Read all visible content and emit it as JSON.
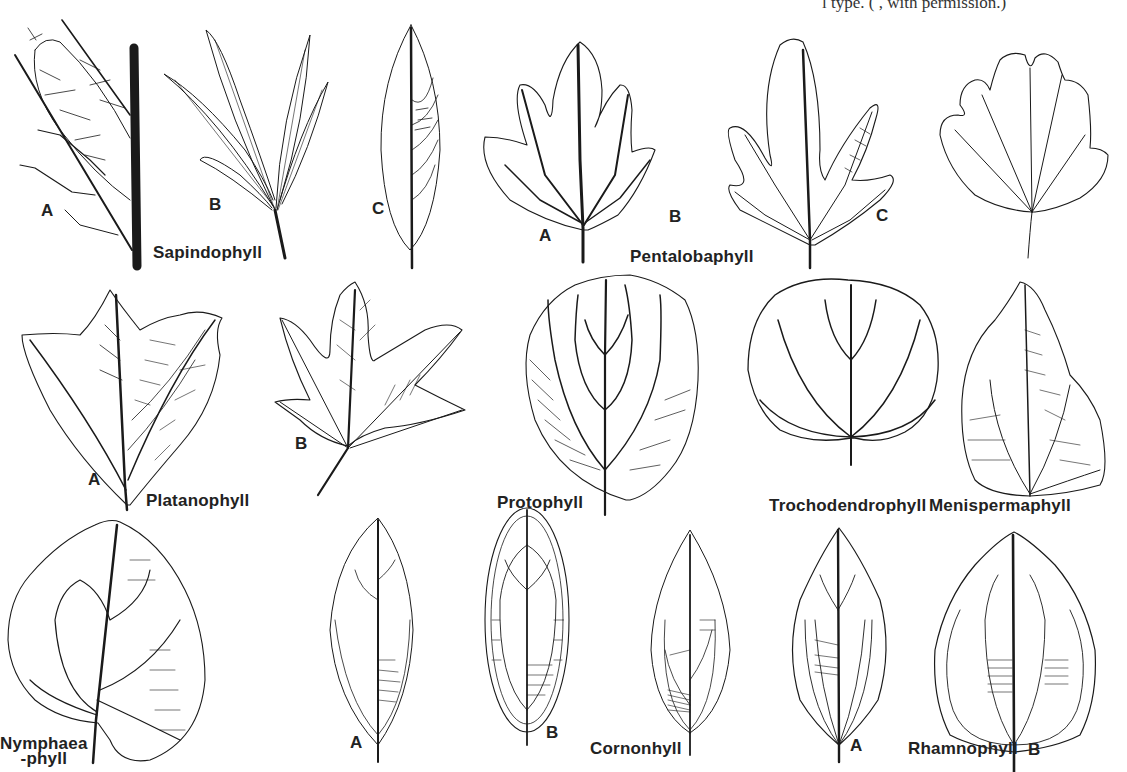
{
  "figure": {
    "caption_fragment": "l type. (               , with permission.)",
    "line_color": "#1a1a1a",
    "background": "#ffffff",
    "rows": [
      {
        "row": 1,
        "morphotypes": [
          {
            "name": "Sapindophyll",
            "variants": [
              "A",
              "B",
              "C"
            ]
          },
          {
            "name": "Pentalobaphyll",
            "variants": [
              "A",
              "B",
              "C"
            ]
          }
        ]
      },
      {
        "row": 2,
        "morphotypes": [
          {
            "name": "Platanophyll",
            "variants": [
              "A",
              "B"
            ]
          },
          {
            "name": "Protophyll",
            "variants": []
          },
          {
            "name": "Trochodendrophyll",
            "variants": []
          },
          {
            "name": "Menispermaphyll",
            "variants": []
          }
        ]
      },
      {
        "row": 3,
        "morphotypes": [
          {
            "name": "Nymphaeaphyll",
            "variants": []
          },
          {
            "name": "Cinnamomophyll",
            "variants": [
              "A",
              "B"
            ]
          },
          {
            "name": "Cornophyll",
            "variants": []
          },
          {
            "name": "Rhamnophyll",
            "variants": [
              "A",
              "B"
            ]
          }
        ]
      }
    ]
  },
  "labels": {
    "sapindophyll": "Sapindophyll",
    "pentalobaphyll": "Pentalobaphyll",
    "platanophyll": "Platanophyll",
    "protophyll": "Protophyll",
    "trochodendrophyll": "Trochodendrophyll",
    "menispermaphyll": "Menispermaphyll",
    "nymphaea_line1": "Nymphaea",
    "nymphaea_line2": "-phyll",
    "cinnamomo_line1": "Cinnamomo-",
    "cinnamomo_line2": "phyll",
    "cornophyll": "Cornonhyll",
    "rhamnophyll": "Rhamnophyll"
  },
  "letters": {
    "sapindo_a": "A",
    "sapindo_b": "B",
    "sapindo_c": "C",
    "pentalo_a": "A",
    "pentalo_b": "B",
    "pentalo_c": "C",
    "platano_a": "A",
    "platano_b": "B",
    "cinnamo_a": "A",
    "cinnamo_b": "B",
    "rhamno_a": "A",
    "rhamno_b": "B"
  }
}
